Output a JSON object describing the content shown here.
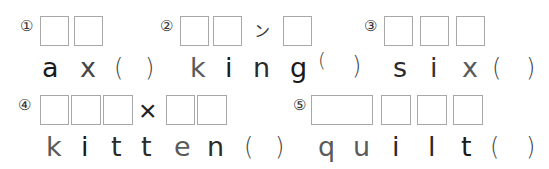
{
  "questions": [
    {
      "number": "①",
      "letters": [
        "a",
        "x"
      ],
      "open_paren": "(",
      "close_paren": ")"
    },
    {
      "number": "②",
      "letters": [
        "k",
        "i",
        "n",
        "g"
      ],
      "mark": "ン",
      "open_paren": "(",
      "close_paren": ")"
    },
    {
      "number": "③",
      "letters": [
        "s",
        "i",
        "x"
      ],
      "open_paren": "(",
      "close_paren": ")"
    },
    {
      "number": "④",
      "letters": [
        "k",
        "i",
        "t",
        "t",
        "e",
        "n"
      ],
      "mark": "×",
      "open_paren": "(",
      "close_paren": ")"
    },
    {
      "number": "⑤",
      "letters": [
        "q",
        "u",
        "i",
        "l",
        "t"
      ],
      "open_paren": "(",
      "close_paren": ")"
    }
  ],
  "colors": {
    "black": "#1a1a1a",
    "dark": "#333333",
    "gray": "#5a5a5a",
    "box_border": "#a8a8a8"
  }
}
